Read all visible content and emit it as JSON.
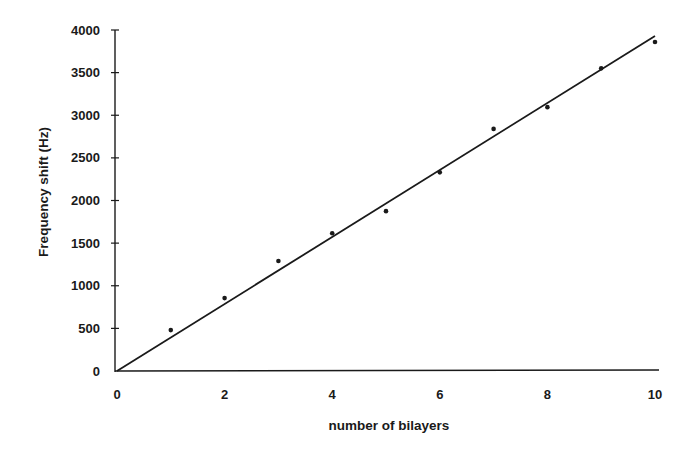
{
  "chart_data": {
    "type": "scatter",
    "title": "",
    "xlabel": "number of bilayers",
    "ylabel": "Frequency shift (Hz)",
    "xlim": [
      0,
      10
    ],
    "ylim": [
      0,
      4000
    ],
    "x_ticks": [
      0,
      2,
      4,
      6,
      8,
      10
    ],
    "y_ticks": [
      0,
      500,
      1000,
      1500,
      2000,
      2500,
      3000,
      3500,
      4000
    ],
    "grid": false,
    "legend": null,
    "series": [
      {
        "name": "measured",
        "kind": "scatter",
        "x": [
          1,
          2,
          3,
          4,
          5,
          6,
          7,
          8,
          9,
          10
        ],
        "y": [
          480,
          855,
          1290,
          1615,
          1875,
          2330,
          2840,
          3095,
          3550,
          3860
        ]
      },
      {
        "name": "linear fit",
        "kind": "line",
        "x": [
          0,
          10
        ],
        "y": [
          0,
          3930
        ]
      }
    ]
  }
}
